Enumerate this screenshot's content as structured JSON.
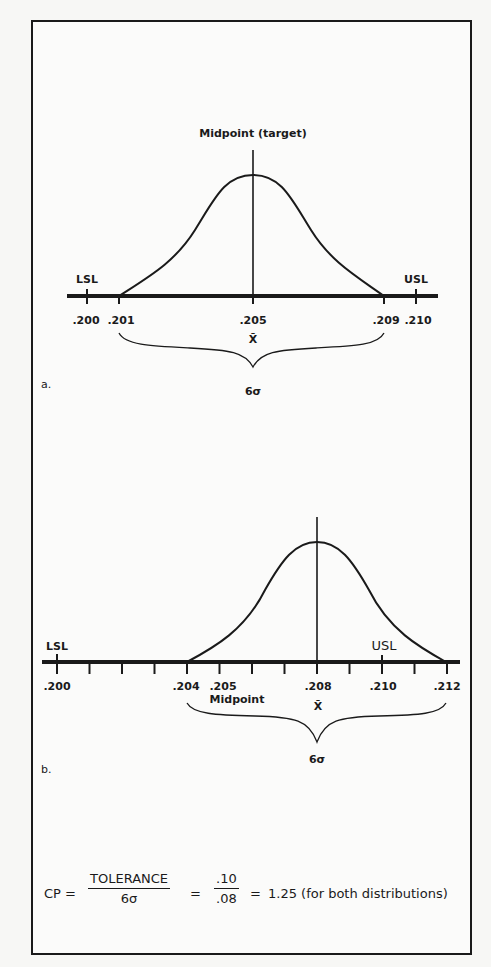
{
  "figure_a": {
    "panel_label": "a.",
    "midpoint_label": "Midpoint (target)",
    "lsl_label": "LSL",
    "usl_label": "USL",
    "ticks": [
      ".200",
      ".201",
      ".205",
      ".209",
      ".210"
    ],
    "mean_symbol": "X̄",
    "spread_label": "6σ"
  },
  "figure_b": {
    "panel_label": "b.",
    "midpoint_label": "Midpoint",
    "lsl_label": "LSL",
    "usl_label": "USL",
    "ticks": [
      ".200",
      ".204",
      ".205",
      ".208",
      ".210",
      ".212"
    ],
    "mean_symbol": "X̄",
    "spread_label": "6σ"
  },
  "formula": {
    "lhs": "CP =",
    "num1": "TOLERANCE",
    "den1": "6σ",
    "eq2": "=",
    "num2": ".10",
    "den2": ".08",
    "eq3": "=",
    "result": "1.25 (for both distributions)"
  },
  "colors": {
    "ink": "#1a1a1a",
    "paper": "#fbfbfa"
  }
}
